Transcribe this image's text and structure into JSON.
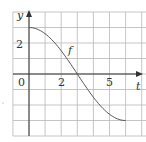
{
  "chart_data": {
    "type": "line",
    "title": "",
    "xlabel": "t",
    "ylabel": "y",
    "series": [
      {
        "name": "f",
        "x": [
          0,
          0.5,
          1,
          1.5,
          2,
          2.5,
          3,
          3.5,
          4,
          4.5,
          5,
          5.5,
          6
        ],
        "values": [
          3,
          2.9,
          2.6,
          2.1,
          1.5,
          0.8,
          0,
          -0.8,
          -1.5,
          -2.1,
          -2.6,
          -2.9,
          -3
        ]
      }
    ],
    "x_tick_labels": [
      {
        "value": 2,
        "label": "2"
      },
      {
        "value": 5,
        "label": "5"
      }
    ],
    "y_tick_labels": [
      {
        "value": 2,
        "label": "2"
      }
    ],
    "origin_label": "0",
    "curve_label": "f",
    "xlim": [
      -1,
      7
    ],
    "ylim": [
      -4,
      4
    ],
    "grid": true,
    "grid_step": 1,
    "legend": "none"
  },
  "labels": {
    "y_axis": "y",
    "x_axis": "t",
    "origin": "0",
    "x_tick_2": "2",
    "x_tick_5": "5",
    "y_tick_2": "2",
    "curve": "f"
  }
}
